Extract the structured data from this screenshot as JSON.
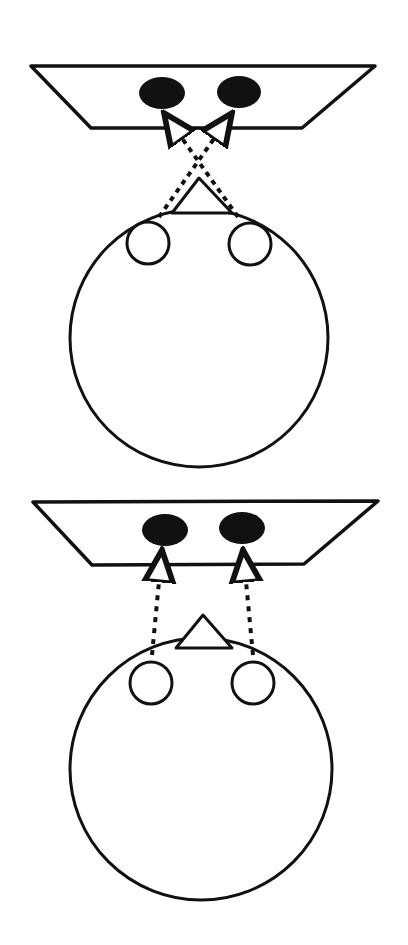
{
  "diagram": {
    "colors": {
      "stroke": "#111111",
      "fill_spot": "#111111",
      "background": "#ffffff"
    },
    "panels": [
      {
        "name": "crossed-view",
        "line_mode": "crossed"
      },
      {
        "name": "parallel-view",
        "line_mode": "parallel"
      }
    ]
  }
}
